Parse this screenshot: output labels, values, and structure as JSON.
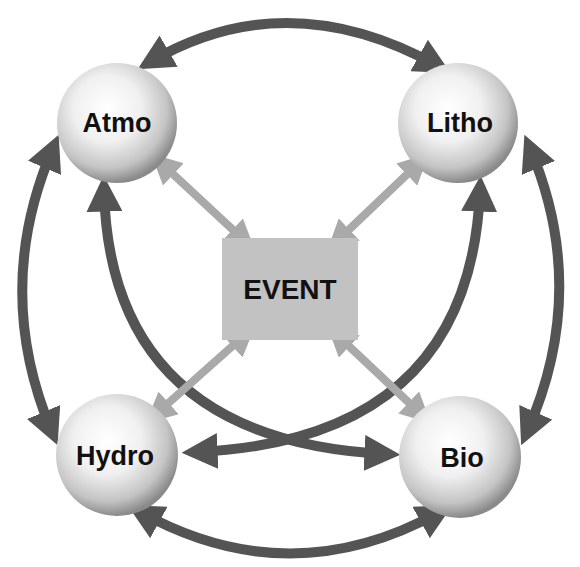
{
  "diagram": {
    "center_node": {
      "label": "EVENT",
      "fill": "#c2c2c2"
    },
    "nodes": [
      {
        "id": "atmo",
        "label": "Atmo"
      },
      {
        "id": "litho",
        "label": "Litho"
      },
      {
        "id": "hydro",
        "label": "Hydro"
      },
      {
        "id": "bio",
        "label": "Bio"
      }
    ],
    "edges": {
      "outer": [
        {
          "from": "Atmo",
          "to": "Litho",
          "bidirectional": true
        },
        {
          "from": "Litho",
          "to": "Bio",
          "bidirectional": true
        },
        {
          "from": "Bio",
          "to": "Hydro",
          "bidirectional": true
        },
        {
          "from": "Hydro",
          "to": "Atmo",
          "bidirectional": true
        }
      ],
      "diagonal": [
        {
          "from": "Atmo",
          "to": "Bio",
          "bidirectional": true
        },
        {
          "from": "Litho",
          "to": "Hydro",
          "bidirectional": true
        }
      ],
      "to_event": [
        {
          "from": "Atmo",
          "to": "EVENT",
          "bidirectional": true
        },
        {
          "from": "Litho",
          "to": "EVENT",
          "bidirectional": true
        },
        {
          "from": "Hydro",
          "to": "EVENT",
          "bidirectional": true
        },
        {
          "from": "Bio",
          "to": "EVENT",
          "bidirectional": true
        }
      ]
    },
    "colors": {
      "dark_arrow": "#545454",
      "light_arrow": "#a9a9a9",
      "sphere_light": "#ffffff",
      "sphere_dark": "#8a8a8a",
      "text": "#111111"
    }
  }
}
